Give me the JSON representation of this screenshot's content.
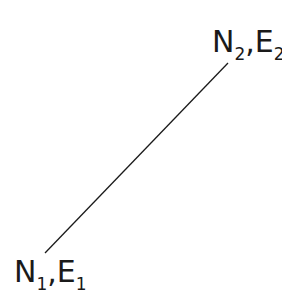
{
  "diagram": {
    "line": {
      "x1": 45,
      "y1": 253,
      "x2": 228,
      "y2": 63,
      "color": "#1a1a1a"
    },
    "point2": {
      "n": "N",
      "n_sub": "2",
      "sep": ",",
      "e": "E",
      "e_sub": "2"
    },
    "point1": {
      "n": "N",
      "n_sub": "1",
      "sep": ",",
      "e": "E",
      "e_sub": "1"
    }
  }
}
